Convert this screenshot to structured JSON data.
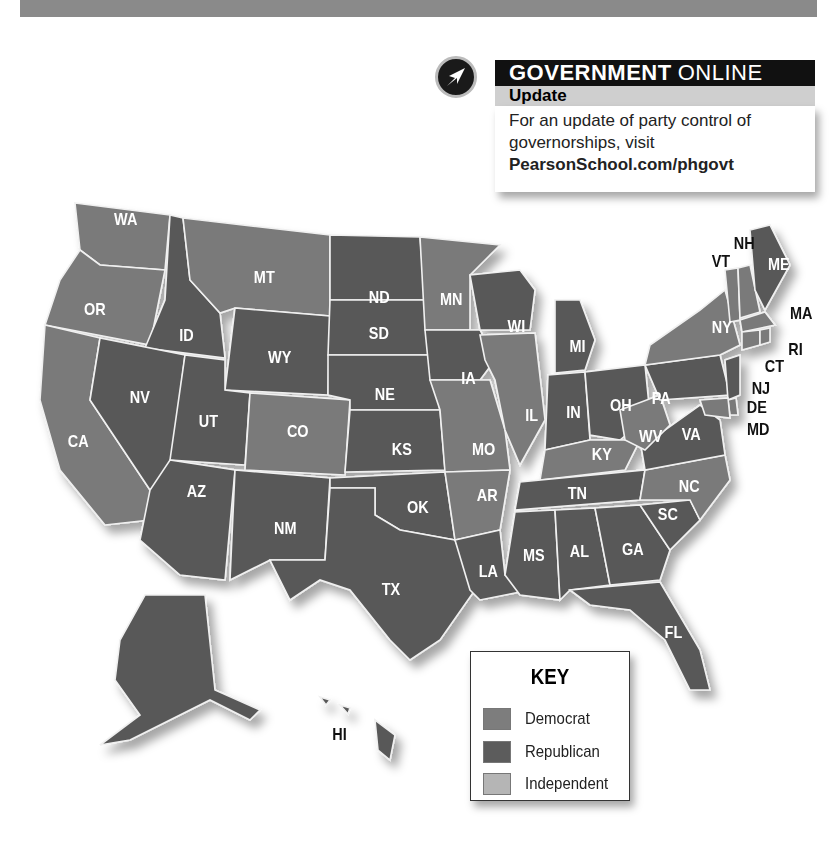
{
  "header_bar": {
    "color": "#8a8a8a"
  },
  "callout": {
    "icon": "arrow-cursor-icon",
    "title_bold": "GOVERNMENT",
    "title_light": "ONLINE",
    "subtitle": "Update",
    "body": "For an update of party control of governorships, visit",
    "link": "PearsonSchool.com/phgovt"
  },
  "key": {
    "title": "KEY",
    "items": [
      {
        "label": "Democrat",
        "color": "#7d7d7d"
      },
      {
        "label": "Republican",
        "color": "#5c5c5c"
      },
      {
        "label": "Independent",
        "color": "#b5b5b5"
      }
    ]
  },
  "map": {
    "colors": {
      "democrat": "#7a7a7a",
      "republican": "#595959",
      "border": "#f0f0f0"
    },
    "states": [
      {
        "abbr": "WA",
        "party": "democrat"
      },
      {
        "abbr": "OR",
        "party": "democrat"
      },
      {
        "abbr": "CA",
        "party": "democrat"
      },
      {
        "abbr": "ID",
        "party": "republican"
      },
      {
        "abbr": "NV",
        "party": "republican"
      },
      {
        "abbr": "MT",
        "party": "democrat"
      },
      {
        "abbr": "WY",
        "party": "republican"
      },
      {
        "abbr": "UT",
        "party": "republican"
      },
      {
        "abbr": "CO",
        "party": "democrat"
      },
      {
        "abbr": "AZ",
        "party": "republican"
      },
      {
        "abbr": "NM",
        "party": "republican"
      },
      {
        "abbr": "ND",
        "party": "republican"
      },
      {
        "abbr": "SD",
        "party": "republican"
      },
      {
        "abbr": "NE",
        "party": "republican"
      },
      {
        "abbr": "KS",
        "party": "republican"
      },
      {
        "abbr": "OK",
        "party": "republican"
      },
      {
        "abbr": "TX",
        "party": "republican"
      },
      {
        "abbr": "MN",
        "party": "democrat"
      },
      {
        "abbr": "IA",
        "party": "republican"
      },
      {
        "abbr": "MO",
        "party": "democrat"
      },
      {
        "abbr": "AR",
        "party": "democrat"
      },
      {
        "abbr": "LA",
        "party": "republican"
      },
      {
        "abbr": "WI",
        "party": "republican"
      },
      {
        "abbr": "IL",
        "party": "democrat"
      },
      {
        "abbr": "MI",
        "party": "republican"
      },
      {
        "abbr": "IN",
        "party": "republican"
      },
      {
        "abbr": "OH",
        "party": "republican"
      },
      {
        "abbr": "KY",
        "party": "democrat"
      },
      {
        "abbr": "TN",
        "party": "republican"
      },
      {
        "abbr": "MS",
        "party": "republican"
      },
      {
        "abbr": "AL",
        "party": "republican"
      },
      {
        "abbr": "GA",
        "party": "republican"
      },
      {
        "abbr": "FL",
        "party": "republican"
      },
      {
        "abbr": "SC",
        "party": "republican"
      },
      {
        "abbr": "NC",
        "party": "democrat"
      },
      {
        "abbr": "VA",
        "party": "republican"
      },
      {
        "abbr": "WV",
        "party": "democrat"
      },
      {
        "abbr": "PA",
        "party": "republican"
      },
      {
        "abbr": "NY",
        "party": "democrat"
      },
      {
        "abbr": "VT",
        "party": "democrat"
      },
      {
        "abbr": "NH",
        "party": "democrat"
      },
      {
        "abbr": "ME",
        "party": "republican"
      },
      {
        "abbr": "MA",
        "party": "democrat"
      },
      {
        "abbr": "RI",
        "party": "democrat"
      },
      {
        "abbr": "CT",
        "party": "democrat"
      },
      {
        "abbr": "NJ",
        "party": "republican"
      },
      {
        "abbr": "DE",
        "party": "democrat"
      },
      {
        "abbr": "MD",
        "party": "democrat"
      },
      {
        "abbr": "AK",
        "party": "republican"
      },
      {
        "abbr": "HI",
        "party": "republican"
      }
    ]
  }
}
